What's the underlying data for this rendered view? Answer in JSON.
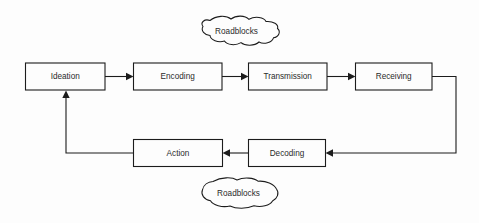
{
  "diagram": {
    "background_color": "#fdfdfd",
    "line_color": "#1c1c1c",
    "text_color": "#2b2b2b",
    "top_row": [
      {
        "id": "ideation",
        "label": "Ideation"
      },
      {
        "id": "encoding",
        "label": "Encoding"
      },
      {
        "id": "transmission",
        "label": "Transmission"
      },
      {
        "id": "receiving",
        "label": "Receiving"
      }
    ],
    "bottom_row": [
      {
        "id": "action",
        "label": "Action"
      },
      {
        "id": "decoding",
        "label": "Decoding"
      }
    ],
    "clouds": [
      {
        "id": "roadblocks-top",
        "label": "Roadblocks"
      },
      {
        "id": "roadblocks-bottom",
        "label": "Roadblocks"
      }
    ],
    "flow_sequence": [
      "Ideation",
      "Encoding",
      "Transmission",
      "Receiving",
      "Decoding",
      "Action",
      "Ideation"
    ],
    "connectors": [
      {
        "from": "Ideation",
        "to": "Encoding",
        "type": "arrow-right"
      },
      {
        "from": "Encoding",
        "to": "Transmission",
        "type": "arrow-right"
      },
      {
        "from": "Transmission",
        "to": "Receiving",
        "type": "arrow-right"
      },
      {
        "from": "Receiving",
        "to": "Decoding",
        "type": "elbow-arrow-left"
      },
      {
        "from": "Decoding",
        "to": "Action",
        "type": "arrow-left"
      },
      {
        "from": "Action",
        "to": "Ideation",
        "type": "elbow-arrow-up"
      }
    ]
  }
}
